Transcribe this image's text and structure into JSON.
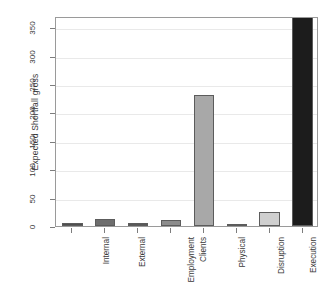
{
  "chart_data": {
    "type": "bar",
    "title": "",
    "xlabel": "",
    "ylabel": "Expected Shortfall gross",
    "categories": [
      "Internal",
      "External",
      "Employment",
      "Clients",
      "Physical",
      "Disruption",
      "Execution",
      "Extreme"
    ],
    "values": [
      6,
      13,
      6,
      10,
      230,
      3,
      25,
      370
    ],
    "bar_colors": [
      "#4f4f4f",
      "#6e6e6e",
      "#595959",
      "#8c8c8c",
      "#a8a8a8",
      "#9b9b9b",
      "#cfcfcf",
      "#1c1c1c"
    ],
    "ylim": [
      0,
      370
    ],
    "y_ticks": [
      0,
      50,
      100,
      150,
      200,
      250,
      300,
      350
    ],
    "y_tick_labels": [
      "0",
      "50",
      "100",
      "150",
      "200",
      "250",
      "300",
      "350"
    ],
    "grid": true,
    "grid_axis": "y",
    "legend": false,
    "legend_position": "none"
  },
  "axes": {
    "y_title": "Expected Shortfall gross"
  }
}
